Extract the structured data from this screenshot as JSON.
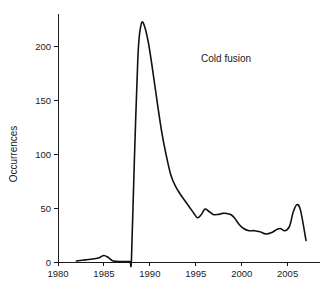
{
  "chart_data": {
    "type": "line",
    "title": "",
    "xlabel": "",
    "ylabel": "Occurrences",
    "xlim": [
      1980,
      2007
    ],
    "ylim": [
      0,
      230
    ],
    "xticks": [
      1980,
      1985,
      1990,
      1995,
      2000,
      2005
    ],
    "yticks": [
      0,
      50,
      100,
      150,
      200
    ],
    "grid": false,
    "legend_position": "none",
    "annotations": [
      {
        "text": "Cold fusion",
        "x": 1998.3,
        "y": 185
      }
    ],
    "series": [
      {
        "name": "Cold fusion",
        "x": [
          1982,
          1983,
          1984,
          1984.5,
          1985,
          1985.5,
          1986,
          1987,
          1987.8,
          1988.0,
          1988.3,
          1988.7,
          1989.0,
          1989.3,
          1989.8,
          1990.3,
          1990.8,
          1991.3,
          1991.8,
          1992.3,
          1992.8,
          1993.3,
          1993.8,
          1994.3,
          1994.8,
          1995.2,
          1995.6,
          1996.0,
          1996.4,
          1996.9,
          1997.4,
          1997.9,
          1998.3,
          1998.8,
          1999.2,
          1999.7,
          2000.2,
          2000.8,
          2001.4,
          2002.0,
          2002.6,
          2003.2,
          2003.8,
          2004.2,
          2004.7,
          2005.2,
          2005.6,
          2006.0,
          2006.4,
          2007.0
        ],
        "values": [
          1,
          2,
          3,
          4,
          6,
          4,
          1,
          0.5,
          0.5,
          3,
          90,
          190,
          218,
          221,
          205,
          178,
          148,
          120,
          98,
          80,
          70,
          63,
          57,
          51,
          45,
          41,
          44,
          49,
          47,
          44,
          44,
          45,
          45,
          44,
          41,
          35,
          31,
          29,
          29,
          28,
          26,
          27,
          30,
          31,
          29,
          33,
          46,
          53,
          48,
          20
        ]
      }
    ]
  },
  "axis": {
    "y_title": "Occurrences",
    "y_tick_labels": [
      "0",
      "50",
      "100",
      "150",
      "200"
    ],
    "x_tick_labels": [
      "1980",
      "1985",
      "1990",
      "1995",
      "2000",
      "2005"
    ]
  },
  "annotation": {
    "cold_fusion_label": "Cold fusion"
  },
  "colors": {
    "line": "#111111",
    "axis": "#1a1a1a",
    "background": "#ffffff",
    "text": "#1a1a1a"
  }
}
